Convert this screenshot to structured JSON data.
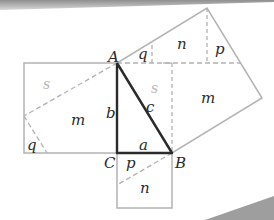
{
  "colors": {
    "square_stroke": "#b3b3b3",
    "dash_stroke": "#b3b3b3",
    "triangle_stroke": "#2b2b2b",
    "label_dark": "#2b2b2b",
    "label_light": "#b8b8b8",
    "shadow": "#9e9e9e"
  },
  "vertices": {
    "A": "A",
    "B": "B",
    "C": "C"
  },
  "sides": {
    "a": "a",
    "b": "b",
    "c": "c"
  },
  "regions": {
    "left_square": {
      "s": "s",
      "m": "m",
      "q": "q"
    },
    "bottom_square": {
      "p": "p",
      "n": "n"
    },
    "hyp_square": {
      "q": "q",
      "n": "n",
      "p": "p",
      "s": "s",
      "m": "m"
    }
  }
}
